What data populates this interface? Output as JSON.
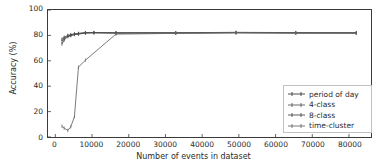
{
  "chart_data": {
    "type": "line",
    "title": "",
    "xlabel": "Number of events in dataset",
    "ylabel": "Accuracy (%)",
    "xlim": [
      -2000,
      86000
    ],
    "ylim": [
      0,
      100
    ],
    "grid": false,
    "legend_position": "lower right",
    "xticks": [
      0,
      10000,
      20000,
      30000,
      40000,
      50000,
      60000,
      70000,
      80000
    ],
    "xtick_labels": [
      "0",
      "10000",
      "20000",
      "30000",
      "40000",
      "50000",
      "60000",
      "70000",
      "80000"
    ],
    "yticks": [
      0,
      20,
      40,
      60,
      80,
      100
    ],
    "ytick_labels": [
      "0",
      "20",
      "40",
      "60",
      "80",
      "100"
    ],
    "series": [
      {
        "name": "period of day",
        "color": "#3b3b3b",
        "x": [
          1800,
          2400,
          3400,
          4200,
          5200,
          6300,
          8200,
          10500,
          16500,
          32800,
          49200,
          65500,
          82000
        ],
        "y": [
          77.0,
          78.5,
          80.0,
          80.6,
          81.2,
          81.6,
          82.2,
          82.3,
          82.1,
          82.1,
          82.4,
          82.2,
          82.1
        ]
      },
      {
        "name": "4-class",
        "color": "#5a5a5a",
        "x": [
          1800,
          2400,
          3400,
          4200,
          5200,
          6300,
          8200,
          10500,
          16500,
          32800,
          49200,
          65500,
          82000
        ],
        "y": [
          75.5,
          77.6,
          79.4,
          80.1,
          80.9,
          81.3,
          82.0,
          82.1,
          81.9,
          81.9,
          82.2,
          82.0,
          82.0
        ]
      },
      {
        "name": "8-class",
        "color": "#4a4a4a",
        "x": [
          1800,
          2400,
          3400,
          4200,
          5200,
          6300,
          8200,
          10500,
          16500,
          32800,
          49200,
          65500,
          82000
        ],
        "y": [
          73.2,
          76.4,
          79.0,
          79.8,
          80.6,
          81.0,
          81.8,
          82.0,
          81.8,
          81.8,
          82.1,
          81.9,
          81.8
        ]
      },
      {
        "name": "time-cluster",
        "color": "#6b6b6b",
        "x": [
          1800,
          2400,
          3400,
          4200,
          5200,
          6300,
          8200,
          16500,
          32800,
          49200,
          65500,
          82000
        ],
        "y": [
          8.5,
          7.0,
          5.2,
          8.0,
          16.0,
          55.0,
          60.5,
          81.0,
          81.6,
          82.0,
          81.8,
          81.8
        ]
      }
    ]
  },
  "legend": {
    "items": [
      {
        "label": "period of day"
      },
      {
        "label": "4-class"
      },
      {
        "label": "8-class"
      },
      {
        "label": "time-cluster"
      }
    ]
  },
  "colors": {
    "axis": "#3b3b3b",
    "text": "#2a2a2a",
    "legend_border": "#c2c2c2",
    "background": "#ffffff"
  }
}
